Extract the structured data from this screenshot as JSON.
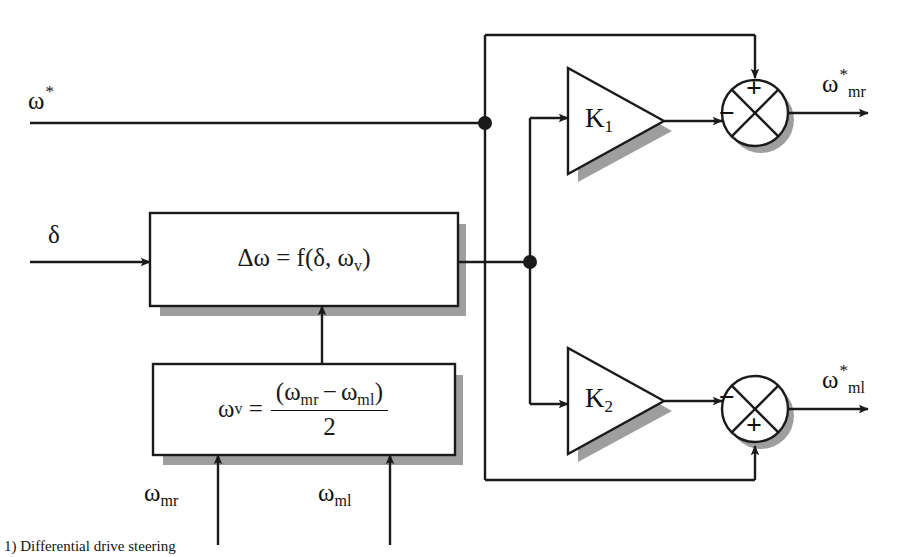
{
  "figure": {
    "type": "block-diagram",
    "caption_fragment": "1) Differential drive steering"
  },
  "inputs": {
    "omega_ref": {
      "base": "ω",
      "sup": "*",
      "sub": ""
    },
    "delta": {
      "base": "δ",
      "sup": "",
      "sub": ""
    },
    "omega_mr": {
      "base": "ω",
      "sup": "",
      "sub": "mr"
    },
    "omega_ml": {
      "base": "ω",
      "sup": "",
      "sub": "ml"
    }
  },
  "outputs": {
    "omega_mr_ref": {
      "base": "ω",
      "sup": "*",
      "sub": "mr"
    },
    "omega_ml_ref": {
      "base": "ω",
      "sup": "*",
      "sub": "ml"
    }
  },
  "blocks": {
    "delta_omega": {
      "name": "delta-omega-function-block",
      "equation_plain": "Δω = f(δ, ω_v)",
      "lhs": "Δω",
      "eq": "=",
      "fn": "f(",
      "arg1": "δ",
      "comma": ",",
      "arg2_base": "ω",
      "arg2_sub": "v",
      "close": ")"
    },
    "omega_v": {
      "name": "omega-v-average-block",
      "equation_plain": "ω_v = (ω_mr − ω_ml) / 2",
      "lhs_base": "ω",
      "lhs_sub": "v",
      "eq": "=",
      "numerator_open": "(",
      "num_left_base": "ω",
      "num_left_sub": "mr",
      "minus": "−",
      "num_right_base": "ω",
      "num_right_sub": "ml",
      "numerator_close": ")",
      "denominator": "2"
    }
  },
  "gains": {
    "k1": {
      "base": "K",
      "sub": "1"
    },
    "k2": {
      "base": "K",
      "sub": "2"
    }
  },
  "summers": {
    "top": {
      "name": "top-summing-junction",
      "sign_top": "+",
      "sign_left": "−",
      "description": "omega-ref plus K1 output minus"
    },
    "bottom": {
      "name": "bottom-summing-junction",
      "sign_bottom": "+",
      "sign_left": "−",
      "description": "omega-ref plus K2 output minus"
    }
  },
  "style": {
    "line_color": "#1a1a1a",
    "shadow_color": "#9a9a9a",
    "background": "#ffffff",
    "line_width": "2.4"
  }
}
